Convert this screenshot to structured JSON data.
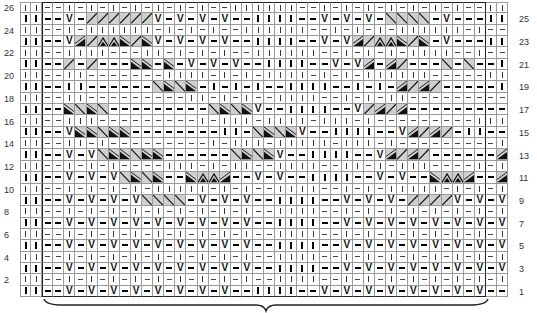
{
  "chart": {
    "type": "knitting-chart",
    "rows": 26,
    "columns": 44,
    "left_row_labels": [
      "26",
      "24",
      "22",
      "20",
      "18",
      "16",
      "14",
      "12",
      "10",
      "8",
      "6",
      "4",
      "2"
    ],
    "right_row_labels": [
      "25",
      "23",
      "21",
      "19",
      "17",
      "15",
      "13",
      "11",
      "9",
      "7",
      "5",
      "3",
      "1"
    ],
    "legend_codes": {
      "|": "knit",
      "-": "purl",
      "V": "slip stitch",
      "/": "cable right (light)",
      "\\": "cable left (light)",
      "d": "cable right (dark)",
      "e": "cable left (dark)",
      "^": "cable apex"
    },
    "grid": [
      "||--|-|-|-|-|-|-|--||||||--|-|-|-|-|-|-|-||",
      "||--V-//////V-V-V-V--||||--V-V-V-\\\\\\\\-V--||",
      "||--|-||||||-|-|-|--||||||--|-|-|-||||||-|--||",
      "||--Vd/^^e/eV-V-V-V--||||--V-Vd/^^e/e-V--||",
      "||--||||---||-|-|-|--||||||--|-|-|-||||--|--||",
      "||--/-/---ee-e-V-V-V--||||--V-Vd-d/---\\-\\--||",
      "||--||-------||||-|-|-||||-|-|-||||||-----||--||",
      "||--||------\\e\\e-|-|-|--||||--|-|-d/d/-----||--||",
      "||--||---------||-|-|--||||--|-|-||---------||--||",
      "||--e\\e\\---------\\e\\eV--||||--V/d/d---------/d/d--||",
      "||--|||---------|-|||-||||-|||-|---------|||--||",
      "||--Vee\\ee--------||-\\e\\eV--||||--Vd/d/-||--------dd/dd--||",
      "||--||-|---------|-|||-|||||-|||-|---------|-||--||",
      "||--V-V\\ee\\ee------\\e\\eV--||||--Vd/d/------dd/dd/V-V--||",
      "||--|-|-|----|||-|-||--||||--||-|-|||----|-|-|--||",
      "||--V-V-V\\e\\e--e^^d--V-V--||||--V-V--e^^d--d/d/V-V-V--||",
      "||--|-|-|-|-|||||-|-|--||||--|-|-|||||-|-|-|--||",
      "||--V-V-V-V\\\\\\\\-V-V-V--||||--V-V-V-////V-V-V-V--||",
      "||--|-|-|-|-|-|-|-|-|--||||--|-|-|-|-|-|-|-|--||",
      "||--V-V-V-V-V-V-V-V-V--||||--V-V-V-V-V-V-V-V-V--||",
      "||--|-|-|-|-|-|-|-|-|--||||--|-|-|-|-|-|-|-|--||",
      "||--V-V-V-V-V-V-V-V-V--||||--V-V-V-V-V-V-V-V-V--||",
      "||--|-|-|-|-|-|-|-|-|--||||--|-|-|-|-|-|-|-|--||",
      "||--V-V-V-V-V-V-V-V-V--||||--V-V-V-V-V-V-V-V-V--||",
      "||--|-|-|-|-|-|-|-|-|--||||--|-|-|-|-|-|-|-|--||",
      "||--V-V-V-V-V-V-V-V--I||I--V-V-V-V-V-V-V-V--||"
    ],
    "brace_label": ""
  }
}
